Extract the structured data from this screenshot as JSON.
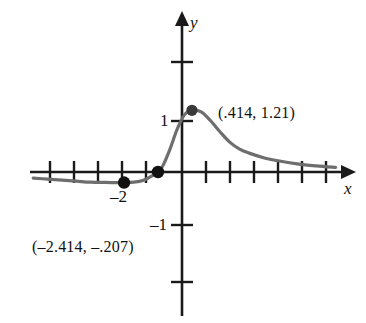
{
  "chart_data": {
    "type": "line",
    "title": "",
    "xlabel": "x",
    "ylabel": "y",
    "grid": false,
    "legend": null,
    "xlim": [
      -6.2,
      7.2
    ],
    "ylim": [
      -4.5,
      3.3
    ],
    "axis_labels": {
      "x": "x",
      "y": "y"
    },
    "tick_labels": {
      "x": [
        "–2"
      ],
      "y": [
        "1",
        "–1"
      ]
    },
    "x_ticks_shown": [
      -5,
      -4,
      -3,
      -2,
      -1,
      1,
      2,
      3,
      4,
      5,
      6
    ],
    "y_ticks_shown": [
      -3,
      -1,
      1,
      2
    ],
    "annotations": [
      {
        "name": "local-maximum",
        "text": "(.414, 1.21)",
        "x": 0.414,
        "y": 1.21
      },
      {
        "name": "local-minimum",
        "text": "(–2.414, –.207)",
        "x": -2.414,
        "y": -0.207
      }
    ],
    "points": [
      {
        "name": "local-minimum-point",
        "x": -2.414,
        "y": -0.207
      },
      {
        "name": "x-intercept-point",
        "x": -1.0,
        "y": 0.0
      },
      {
        "name": "local-maximum-point",
        "x": 0.414,
        "y": 1.21
      }
    ],
    "curve": {
      "description": "rises from a shallow negative tail on the left through a local minimum, crosses the x-axis near x = -1, peaks just above y = 1, then decays asymptotically toward the x-axis on the right",
      "x": [
        -6.2,
        -5.6,
        -5.0,
        -4.4,
        -3.8,
        -3.2,
        -2.8,
        -2.414,
        -2.0,
        -1.6,
        -1.2,
        -1.0,
        -0.8,
        -0.5,
        -0.2,
        0.1,
        0.414,
        0.8,
        1.2,
        1.6,
        2.0,
        2.4,
        2.8,
        3.4,
        4.0,
        4.8,
        5.6,
        6.4
      ],
      "y": [
        -0.12,
        -0.14,
        -0.16,
        -0.18,
        -0.2,
        -0.205,
        -0.207,
        -0.207,
        -0.2,
        -0.16,
        -0.06,
        0.0,
        0.12,
        0.45,
        0.84,
        1.12,
        1.21,
        1.18,
        1.0,
        0.78,
        0.58,
        0.45,
        0.37,
        0.28,
        0.22,
        0.16,
        0.12,
        0.09
      ]
    },
    "colors": {
      "curve": "#6e6e6e",
      "axis": "#1a1a1a",
      "point": "#111111",
      "text": "#111111",
      "background": "#ffffff"
    }
  }
}
